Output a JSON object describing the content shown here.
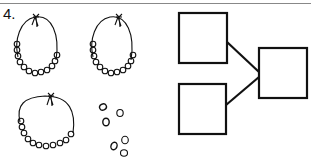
{
  "problem": {
    "number_label": "4.",
    "necklaces": [
      {
        "cx": 35,
        "cy": 46,
        "beads": 12
      },
      {
        "cx": 117,
        "cy": 46,
        "beads": 12
      },
      {
        "cx": 35,
        "cy": 125,
        "beads": 11
      }
    ],
    "loose_beads_count": 6,
    "number_bond": {
      "part_boxes": 2,
      "whole_boxes": 1,
      "values": [
        "",
        "",
        ""
      ]
    }
  }
}
